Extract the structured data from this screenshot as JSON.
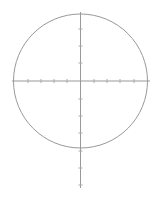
{
  "diagram": {
    "stroke_color": "#999999",
    "tick_color": "#aaaaaa",
    "circle": {
      "cx": 80.5,
      "cy": 81,
      "r": 67
    },
    "h_axis": {
      "x1": 12,
      "x2": 150,
      "y": 81
    },
    "v_axis": {
      "x": 80.5,
      "y1": 12,
      "y2": 188
    },
    "h_ticks": [
      28,
      41,
      54,
      67,
      94,
      107,
      120,
      134
    ],
    "v_ticks": [
      29,
      46,
      63,
      99,
      116,
      133,
      151,
      168,
      185
    ]
  }
}
